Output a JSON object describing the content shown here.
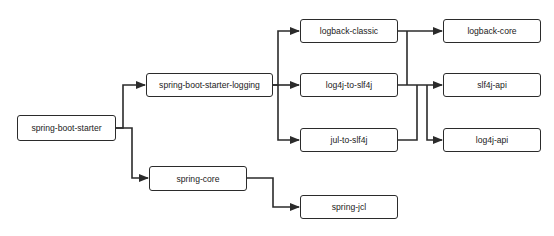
{
  "diagram": {
    "type": "dependency-tree",
    "colors": {
      "line": "#2b2b2b",
      "box_border": "#2b2b2b",
      "text": "#222222",
      "background": "#ffffff"
    },
    "nodes": [
      {
        "id": "spring-boot-starter",
        "label": "spring-boot-starter"
      },
      {
        "id": "spring-boot-starter-logging",
        "label": "spring-boot-starter-logging"
      },
      {
        "id": "spring-core",
        "label": "spring-core"
      },
      {
        "id": "logback-classic",
        "label": "logback-classic"
      },
      {
        "id": "log4j-to-slf4j",
        "label": "log4j-to-slf4j"
      },
      {
        "id": "jul-to-slf4j",
        "label": "jul-to-slf4j"
      },
      {
        "id": "spring-jcl",
        "label": "spring-jcl"
      },
      {
        "id": "logback-core",
        "label": "logback-core"
      },
      {
        "id": "slf4j-api",
        "label": "slf4j-api"
      },
      {
        "id": "log4j-api",
        "label": "log4j-api"
      }
    ],
    "edges": [
      {
        "from": "spring-boot-starter",
        "to": "spring-boot-starter-logging"
      },
      {
        "from": "spring-boot-starter",
        "to": "spring-core"
      },
      {
        "from": "spring-boot-starter-logging",
        "to": "logback-classic"
      },
      {
        "from": "spring-boot-starter-logging",
        "to": "log4j-to-slf4j"
      },
      {
        "from": "spring-boot-starter-logging",
        "to": "jul-to-slf4j"
      },
      {
        "from": "spring-core",
        "to": "spring-jcl"
      },
      {
        "from": "logback-classic",
        "to": "logback-core"
      },
      {
        "from": "logback-classic",
        "to": "slf4j-api"
      },
      {
        "from": "log4j-to-slf4j",
        "to": "slf4j-api"
      },
      {
        "from": "log4j-to-slf4j",
        "to": "log4j-api"
      },
      {
        "from": "jul-to-slf4j",
        "to": "slf4j-api"
      }
    ]
  }
}
